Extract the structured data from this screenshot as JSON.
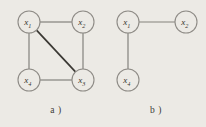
{
  "figure": {
    "background_color": "#eceae5",
    "node_stroke_color": "#8e8b86",
    "edge_color": "#84817c",
    "edge_emphasis_color": "#3a3833",
    "label_color": "#35332f",
    "node_radius": 11,
    "panels": [
      {
        "id": "a",
        "caption": "a )",
        "caption_x": 56,
        "caption_y": 110,
        "nodes": [
          {
            "id": "x1",
            "base": "x",
            "sub": "1",
            "cx": 29,
            "cy": 22
          },
          {
            "id": "x2",
            "base": "x",
            "sub": "2",
            "cx": 83,
            "cy": 22
          },
          {
            "id": "x4",
            "base": "x",
            "sub": "4",
            "cx": 29,
            "cy": 80
          },
          {
            "id": "x3",
            "base": "x",
            "sub": "3",
            "cx": 83,
            "cy": 80
          }
        ],
        "edges": [
          {
            "id": "x1-x2",
            "from": "x1",
            "to": "x2",
            "emphasis": false
          },
          {
            "id": "x1-x4",
            "from": "x1",
            "to": "x4",
            "emphasis": false
          },
          {
            "id": "x2-x3",
            "from": "x2",
            "to": "x3",
            "emphasis": false
          },
          {
            "id": "x4-x3",
            "from": "x4",
            "to": "x3",
            "emphasis": false
          },
          {
            "id": "x1-x3",
            "from": "x1",
            "to": "x3",
            "emphasis": true
          }
        ]
      },
      {
        "id": "b",
        "caption": "b )",
        "caption_x": 156,
        "caption_y": 110,
        "nodes": [
          {
            "id": "x1",
            "base": "x",
            "sub": "1",
            "cx": 128,
            "cy": 22
          },
          {
            "id": "x2",
            "base": "x",
            "sub": "2",
            "cx": 186,
            "cy": 22
          },
          {
            "id": "x4",
            "base": "x",
            "sub": "4",
            "cx": 128,
            "cy": 80
          }
        ],
        "edges": [
          {
            "id": "x1-x2",
            "from": "x1",
            "to": "x2",
            "emphasis": false
          },
          {
            "id": "x1-x4",
            "from": "x1",
            "to": "x4",
            "emphasis": false
          }
        ]
      }
    ]
  }
}
